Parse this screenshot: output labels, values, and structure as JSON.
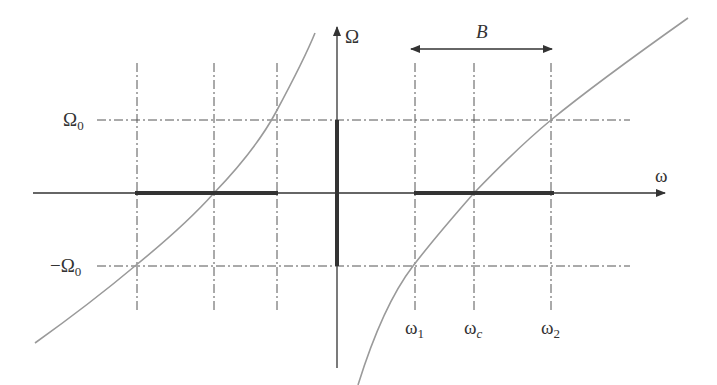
{
  "diagram": {
    "axes": {
      "vertical_label": "Ω",
      "horizontal_label": "ω"
    },
    "levels": {
      "upper": {
        "symbol": "Ω",
        "sub": "0",
        "prefix": ""
      },
      "lower": {
        "symbol": "Ω",
        "sub": "0",
        "prefix": "−"
      }
    },
    "frequencies": [
      {
        "symbol": "ω",
        "sub": "1"
      },
      {
        "symbol": "ω",
        "sub": "c"
      },
      {
        "symbol": "ω",
        "sub": "2"
      }
    ],
    "bandwidth_label": "B",
    "colors": {
      "axis": "#333333",
      "curve": "#9a9a9a",
      "dashed": "#555555",
      "band": "#333333"
    }
  }
}
